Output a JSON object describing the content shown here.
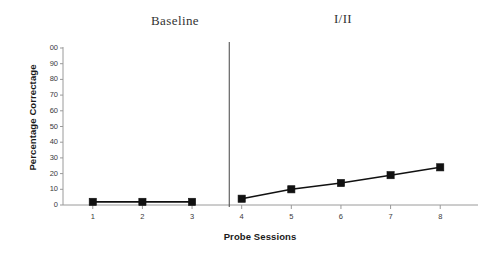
{
  "chart_data": {
    "type": "line",
    "title": "",
    "xlabel": "Probe Sessions",
    "ylabel": "Percentage Correctage",
    "x": [
      1,
      2,
      3,
      4,
      5,
      6,
      7,
      8
    ],
    "xlim": [
      0.4,
      8.6
    ],
    "ylim": [
      0,
      100
    ],
    "ytick_labels": [
      "00",
      "90",
      "80",
      "70",
      "60",
      "50",
      "40",
      "30",
      "20",
      "10",
      "0"
    ],
    "yticks": [
      100,
      90,
      80,
      70,
      60,
      50,
      40,
      30,
      20,
      10,
      0
    ],
    "xtick_labels": [
      "1",
      "2",
      "3",
      "4",
      "5",
      "6",
      "7",
      "8"
    ],
    "xticks": [
      1,
      2,
      3,
      4,
      5,
      6,
      7,
      8
    ],
    "grid": false,
    "legend": "none",
    "marker": "filled-square",
    "line_color": "#111111",
    "marker_color": "#111111",
    "axis_color": "#9a9a9a",
    "series": [
      {
        "name": "Baseline",
        "phase": "Baseline",
        "x": [
          1,
          2,
          3
        ],
        "values": [
          2,
          2,
          2
        ]
      },
      {
        "name": "I/II",
        "phase": "I/II",
        "x": [
          4,
          5,
          6,
          7,
          8
        ],
        "values": [
          4,
          10,
          14,
          19,
          24
        ]
      }
    ],
    "phase_captions": [
      {
        "label": "Baseline"
      },
      {
        "label": "I/II"
      }
    ],
    "phase_change_line": {
      "x": 3.75
    }
  }
}
